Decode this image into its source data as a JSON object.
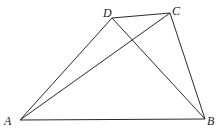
{
  "diagram": {
    "type": "geometry-quadrilateral",
    "points": {
      "A": {
        "x": 20,
        "y": 120,
        "label": "A",
        "lx": 4,
        "ly": 125
      },
      "B": {
        "x": 205,
        "y": 119,
        "label": "B",
        "lx": 207,
        "ly": 125
      },
      "C": {
        "x": 170,
        "y": 13,
        "label": "C",
        "lx": 172,
        "ly": 15
      },
      "D": {
        "x": 112,
        "y": 18,
        "label": "D",
        "lx": 103,
        "ly": 17
      }
    },
    "segments": [
      [
        "A",
        "B"
      ],
      [
        "B",
        "C"
      ],
      [
        "C",
        "D"
      ],
      [
        "D",
        "A"
      ],
      [
        "A",
        "C"
      ],
      [
        "D",
        "B"
      ]
    ]
  }
}
